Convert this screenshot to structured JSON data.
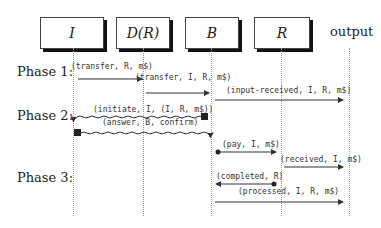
{
  "participants": [
    {
      "label": "I",
      "x": 73
    },
    {
      "label": "D(R)",
      "x": 143
    },
    {
      "label": "B",
      "x": 211
    },
    {
      "label": "R",
      "x": 281
    }
  ],
  "output_label": "output",
  "phases": [
    {
      "label": "Phase 1:",
      "y": 58
    },
    {
      "label": "Phase 2:",
      "y": 103
    },
    {
      "label": "Phase 3:",
      "y": 170
    }
  ],
  "messages": [
    {
      "label": "(transfer, R, m$)",
      "from": "I",
      "to": "D(R)",
      "style": "solid"
    },
    {
      "label": "(transfer, I, R, m$)",
      "from": "D(R)",
      "to": "B",
      "style": "solid"
    },
    {
      "label": "(input-received, I, R, m$)",
      "from": "B",
      "to": "output",
      "style": "solid"
    },
    {
      "label": "(initiate, I, (I, R, m$))",
      "from": "D(R)",
      "to": "I",
      "style": "wavy"
    },
    {
      "label": "(answer, B, confirm)",
      "from": "I",
      "to": "D(R)",
      "style": "wavy"
    },
    {
      "label": "(pay, I, m$)",
      "from": "B",
      "to": "R",
      "style": "solid"
    },
    {
      "label": "(received, I, m$)",
      "from": "R",
      "to": "output",
      "style": "solid"
    },
    {
      "label": "(completed, R)",
      "from": "R",
      "to": "B",
      "style": "solid"
    },
    {
      "label": "(processed, I, R, m$)",
      "from": "B",
      "to": "output",
      "style": "solid"
    }
  ]
}
